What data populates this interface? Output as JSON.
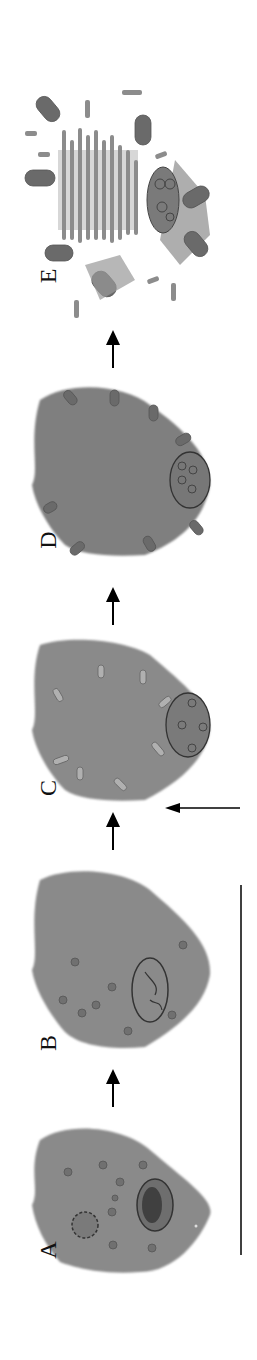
{
  "figure": {
    "stages": [
      {
        "label": "A",
        "name": "stage-a"
      },
      {
        "label": "B",
        "name": "stage-b"
      },
      {
        "label": "C",
        "name": "stage-c"
      },
      {
        "label": "D",
        "name": "stage-d"
      },
      {
        "label": "E",
        "name": "stage-e"
      }
    ],
    "colors": {
      "cell": "#8a8a8a",
      "cell_dark": "#6e6e6e",
      "outline": "#3a3a3a",
      "arrow": "#000000",
      "background": "#ffffff"
    }
  }
}
